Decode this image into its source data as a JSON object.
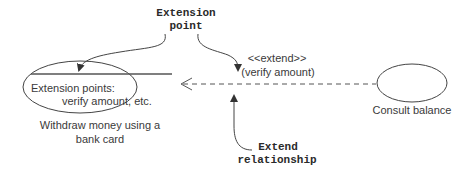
{
  "callouts": {
    "extension_point": [
      "Extension",
      "point"
    ],
    "extend_relationship": [
      "Extend",
      "relationship"
    ]
  },
  "use_cases": {
    "withdraw": {
      "compartment_title": "Extension points:",
      "compartment_value": "verify amount, etc.",
      "name_lines": [
        "Withdraw money using a",
        "bank card"
      ]
    },
    "consult": {
      "name": "Consult balance"
    }
  },
  "relationship": {
    "stereotype": "<<extend>>",
    "condition": "(verify amount)"
  },
  "colors": {
    "line": "#4a4a4a",
    "text": "#3a3a3a",
    "callout_text": "#2a2a2a"
  }
}
